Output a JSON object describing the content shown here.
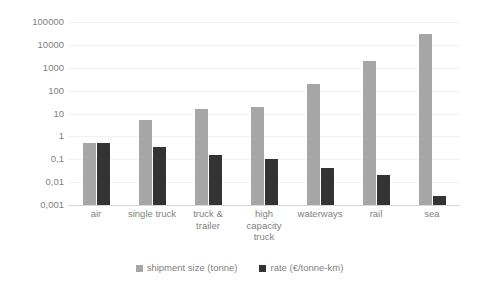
{
  "chart_data": {
    "type": "bar",
    "title": "",
    "subtitle": "",
    "xlabel": "",
    "ylabel": "",
    "yscale": "log",
    "ylim": [
      0.001,
      100000
    ],
    "grid": true,
    "legend_position": "bottom",
    "decimal_separator": ",",
    "categories": [
      "air",
      "single truck",
      "truck & trailer",
      "high capacity truck",
      "waterways",
      "rail",
      "sea"
    ],
    "category_labels": [
      [
        "air"
      ],
      [
        "single truck"
      ],
      [
        "truck &",
        "trailer"
      ],
      [
        "high",
        "capacity",
        "truck"
      ],
      [
        "waterways"
      ],
      [
        "rail"
      ],
      [
        "sea"
      ]
    ],
    "ytick_labels": [
      "100000",
      "10000",
      "1000",
      "100",
      "10",
      "1",
      "0,1",
      "0,01",
      "0,001"
    ],
    "ytick_values": [
      100000,
      10000,
      1000,
      100,
      10,
      1,
      0.1,
      0.01,
      0.001
    ],
    "series": [
      {
        "name": "shipment size (tonne)",
        "color": "#a6a6a6",
        "values": [
          0.5,
          5,
          16,
          20,
          200,
          2000,
          30000
        ]
      },
      {
        "name": "rate (€/tonne-km)",
        "color": "#333333",
        "values": [
          0.5,
          0.35,
          0.15,
          0.1,
          0.04,
          0.02,
          0.0025
        ]
      }
    ]
  },
  "legend": {
    "entries": [
      {
        "label": "shipment size (tonne)"
      },
      {
        "label": "rate (€/tonne-km)"
      }
    ]
  },
  "colors": {
    "series_0": "#a6a6a6",
    "series_1": "#333333",
    "gridline": "#f2f2f2",
    "axis": "#d9d9d9",
    "text": "#7f7f7f",
    "background": "#ffffff"
  }
}
